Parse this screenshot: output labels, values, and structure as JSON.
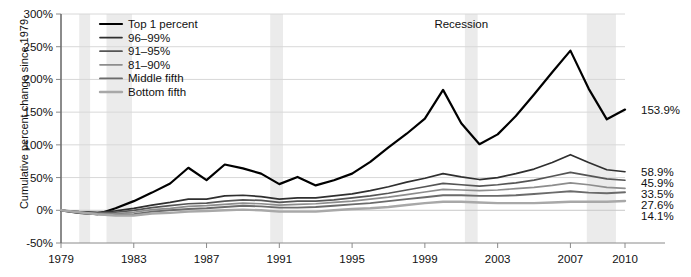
{
  "chart_data": {
    "type": "line",
    "title": "",
    "xlabel": "",
    "ylabel": "Cumulative percent change since 1979",
    "xlim": [
      1979,
      2010
    ],
    "ylim": [
      -50,
      300
    ],
    "ytick_labels": [
      "300%",
      "250%",
      "200%",
      "150%",
      "100%",
      "50%",
      "0%",
      "-50%"
    ],
    "ytick_values": [
      300,
      250,
      200,
      150,
      100,
      50,
      0,
      -50
    ],
    "xtick_labels": [
      "1979",
      "1983",
      "1987",
      "1991",
      "1995",
      "1999",
      "2003",
      "2007",
      "2010"
    ],
    "xtick_values": [
      1979,
      1983,
      1987,
      1991,
      1995,
      1999,
      2003,
      2007,
      2010
    ],
    "grid": true,
    "legend_position": "top-left",
    "annotations": [
      {
        "text": "Recession",
        "x": 2001.0,
        "y": 285
      }
    ],
    "shaded_regions": [
      {
        "label": "Recession",
        "x0": 1980.0,
        "x1": 1980.6
      },
      {
        "label": "Recession",
        "x0": 1981.5,
        "x1": 1982.9
      },
      {
        "label": "Recession",
        "x0": 1990.5,
        "x1": 1991.2
      },
      {
        "label": "Recession",
        "x0": 2001.2,
        "x1": 2001.9
      },
      {
        "label": "Recession",
        "x0": 2007.9,
        "x1": 2009.5
      }
    ],
    "x": [
      1979,
      1980,
      1981,
      1982,
      1983,
      1984,
      1985,
      1986,
      1987,
      1988,
      1989,
      1990,
      1991,
      1992,
      1993,
      1994,
      1995,
      1996,
      1997,
      1998,
      1999,
      2000,
      2001,
      2002,
      2003,
      2004,
      2005,
      2006,
      2007,
      2008,
      2009,
      2010
    ],
    "series": [
      {
        "name": "Top 1 percent",
        "color": "#000000",
        "width": 2.2,
        "end_label": "153.9%",
        "end_value": 153.9,
        "values": [
          0,
          -4,
          -6,
          3,
          14,
          27,
          41,
          65,
          46,
          70,
          64,
          56,
          40,
          51,
          38,
          46,
          56,
          74,
          96,
          117,
          140,
          184,
          133,
          101,
          116,
          144,
          177,
          211,
          244,
          186,
          139,
          153.9
        ]
      },
      {
        "name": "96–99%",
        "color": "#2f2f2f",
        "width": 1.7,
        "end_label": "58.9%",
        "end_value": 58.9,
        "values": [
          0,
          -2,
          -3,
          -1,
          3,
          8,
          12,
          17,
          17,
          22,
          23,
          21,
          17,
          19,
          19,
          22,
          25,
          30,
          36,
          43,
          49,
          56,
          51,
          47,
          50,
          56,
          63,
          73,
          85,
          73,
          62,
          58.9
        ]
      },
      {
        "name": "91–95%",
        "color": "#555555",
        "width": 1.7,
        "end_label": "45.9%",
        "end_value": 45.9,
        "values": [
          0,
          -3,
          -4,
          -3,
          0,
          4,
          7,
          10,
          11,
          14,
          16,
          15,
          12,
          14,
          14,
          16,
          19,
          22,
          26,
          31,
          36,
          41,
          39,
          37,
          39,
          42,
          46,
          52,
          58,
          53,
          48,
          45.9
        ]
      },
      {
        "name": "81–90%",
        "color": "#8d8d8d",
        "width": 1.7,
        "end_label": "33.5%",
        "end_value": 33.5,
        "values": [
          0,
          -3,
          -5,
          -5,
          -3,
          1,
          3,
          6,
          7,
          9,
          11,
          10,
          8,
          9,
          10,
          12,
          14,
          17,
          20,
          24,
          28,
          32,
          31,
          30,
          31,
          33,
          35,
          38,
          42,
          39,
          35,
          33.5
        ]
      },
      {
        "name": "Middle fifth",
        "color": "#6b6b6b",
        "width": 1.9,
        "end_label": "27.6%",
        "end_value": 27.6,
        "values": [
          0,
          -4,
          -6,
          -7,
          -6,
          -2,
          0,
          2,
          3,
          5,
          7,
          6,
          4,
          4,
          5,
          7,
          9,
          11,
          14,
          17,
          20,
          23,
          23,
          22,
          22,
          23,
          25,
          27,
          29,
          27,
          26,
          27.6
        ]
      },
      {
        "name": "Bottom fifth",
        "color": "#a8a8a8",
        "width": 2.4,
        "end_label": "14.1%",
        "end_value": 14.1,
        "values": [
          0,
          -3,
          -6,
          -8,
          -8,
          -5,
          -4,
          -2,
          -1,
          0,
          1,
          0,
          -2,
          -2,
          -2,
          0,
          2,
          3,
          5,
          8,
          11,
          13,
          13,
          12,
          11,
          11,
          11,
          12,
          13,
          13,
          13,
          14.1
        ]
      }
    ]
  },
  "legend": {
    "items": [
      {
        "label": "Top 1 percent"
      },
      {
        "label": "96–99%"
      },
      {
        "label": "91–95%"
      },
      {
        "label": "81–90%"
      },
      {
        "label": "Middle fifth"
      },
      {
        "label": "Bottom fifth"
      }
    ]
  }
}
